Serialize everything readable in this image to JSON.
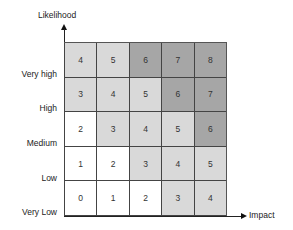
{
  "axes": {
    "y_title": "Likelihood",
    "x_title": "Impact"
  },
  "rows": [
    {
      "label": "Very high",
      "values": [
        "4",
        "5",
        "6",
        "7",
        "8"
      ]
    },
    {
      "label": "High",
      "values": [
        "3",
        "4",
        "5",
        "6",
        "7"
      ]
    },
    {
      "label": "Medium",
      "values": [
        "2",
        "3",
        "4",
        "5",
        "6"
      ]
    },
    {
      "label": "Low",
      "values": [
        "1",
        "2",
        "3",
        "4",
        "5"
      ]
    },
    {
      "label": "Very Low",
      "values": [
        "0",
        "1",
        "2",
        "3",
        "4"
      ]
    }
  ],
  "colors": {
    "score_0": "#ffffff",
    "score_1": "#ffffff",
    "score_2": "#ffffff",
    "score_3": "#d9d9d9",
    "score_4": "#d9d9d9",
    "score_5": "#d9d9d9",
    "score_6": "#a6a6a6",
    "score_7": "#a6a6a6",
    "score_8": "#a6a6a6"
  }
}
